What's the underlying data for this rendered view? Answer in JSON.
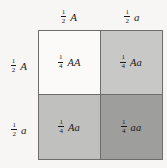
{
  "figure": {
    "type": "punnett-square",
    "title": "",
    "background_color": "#f7f6f4",
    "border_color": "#6d6d6d"
  },
  "column_headers": [
    {
      "fraction_numerator": "1",
      "fraction_denominator": "2",
      "allele": "A"
    },
    {
      "fraction_numerator": "1",
      "fraction_denominator": "2",
      "allele": "a"
    }
  ],
  "row_headers": [
    {
      "fraction_numerator": "1",
      "fraction_denominator": "2",
      "allele": "A"
    },
    {
      "fraction_numerator": "1",
      "fraction_denominator": "2",
      "allele": "a"
    }
  ],
  "cells": [
    {
      "position": "top-left",
      "fraction_numerator": "1",
      "fraction_denominator": "4",
      "genotype": "AA",
      "fill_color": "#fbfaf8"
    },
    {
      "position": "top-right",
      "fraction_numerator": "1",
      "fraction_denominator": "4",
      "genotype": "Aa",
      "fill_color": "#c8c8c6"
    },
    {
      "position": "bottom-left",
      "fraction_numerator": "1",
      "fraction_denominator": "4",
      "genotype": "Aa",
      "fill_color": "#c0c0be"
    },
    {
      "position": "bottom-right",
      "fraction_numerator": "1",
      "fraction_denominator": "4",
      "genotype": "aa",
      "fill_color": "#9e9e9c"
    }
  ]
}
